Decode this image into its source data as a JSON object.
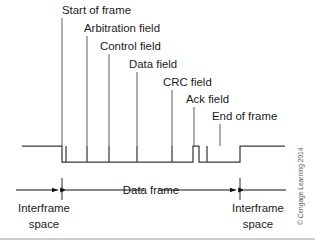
{
  "figure": {
    "credit": "© Cengage Learning 2014",
    "colors": {
      "ink": "#1a1a1a",
      "waveform": "#3a3a3a",
      "leader": "#4a4a4a",
      "dimension": "#111111",
      "background": "#ffffff",
      "credit": "#555555"
    }
  },
  "callouts": [
    {
      "label": "Start of frame",
      "text_x": 62,
      "text_y": 14,
      "leader_x": 62,
      "leader_y1": 18,
      "leader_y2": 146
    },
    {
      "label": "Arbitration field",
      "text_x": 84,
      "text_y": 32,
      "leader_x": 87,
      "leader_y1": 36,
      "leader_y2": 146
    },
    {
      "label": "Control field",
      "text_x": 100,
      "text_y": 50,
      "leader_x": 109,
      "leader_y1": 54,
      "leader_y2": 146
    },
    {
      "label": "Data field",
      "text_x": 129,
      "text_y": 68,
      "leader_x": 137,
      "leader_y1": 72,
      "leader_y2": 146
    },
    {
      "label": "CRC field",
      "text_x": 163,
      "text_y": 86,
      "leader_x": 172,
      "leader_y1": 90,
      "leader_y2": 146
    },
    {
      "label": "Ack field",
      "text_x": 186,
      "text_y": 103,
      "leader_x": 194,
      "leader_y1": 107,
      "leader_y2": 146
    },
    {
      "label": "End of frame",
      "text_x": 212,
      "text_y": 120,
      "leader_x": 220,
      "leader_y1": 124,
      "leader_y2": 146
    }
  ],
  "waveform": {
    "idle_level_y": 146,
    "active_level_y": 162,
    "left_idle_start_x": 22,
    "right_idle_end_x": 285,
    "path": "M22,146 L62,146 L62,162 L193,162 L193,146 L199,146 L199,162 L240,162 L240,146 L285,146",
    "dividers": [
      {
        "x": 66,
        "y1": 146,
        "y2": 162
      },
      {
        "x": 87,
        "y1": 146,
        "y2": 162
      },
      {
        "x": 109,
        "y1": 146,
        "y2": 162
      },
      {
        "x": 137,
        "y1": 146,
        "y2": 162
      },
      {
        "x": 172,
        "y1": 146,
        "y2": 162
      },
      {
        "x": 207,
        "y1": 146,
        "y2": 162
      }
    ],
    "top_rail_segments": [
      {
        "x1": 62,
        "x2": 193,
        "y": 146
      },
      {
        "x1": 199,
        "x2": 240,
        "y": 146
      }
    ]
  },
  "dimensions": {
    "row_y": 190,
    "boundary_ticks": [
      {
        "x": 62,
        "y1": 178,
        "y2": 200
      },
      {
        "x": 240,
        "y1": 178,
        "y2": 200
      }
    ],
    "data_frame": {
      "label": "Data frame",
      "label_x": 151,
      "label_y": 194,
      "left_arrow_tail_x": 144,
      "left_arrow_head_x": 66,
      "right_arrow_tail_x": 158,
      "right_arrow_head_x": 236
    },
    "interframe_left": {
      "label_line1": "Interframe",
      "label_line2": "space",
      "label_x": 44,
      "label_y1": 212,
      "label_y2": 228,
      "arrow_tail_x": 16,
      "arrow_head_x": 58
    },
    "interframe_right": {
      "label_line1": "Interframe",
      "label_line2": "space",
      "label_x": 258,
      "label_y1": 212,
      "label_y2": 228,
      "arrow_tail_x": 286,
      "arrow_head_x": 244
    }
  },
  "footer_rule": {
    "y": 239,
    "x1": 0,
    "x2": 315
  }
}
